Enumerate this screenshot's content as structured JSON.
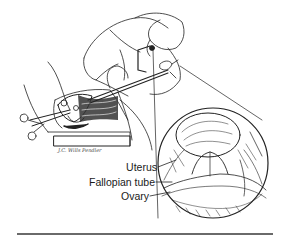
{
  "figure": {
    "labels": [
      {
        "id": "uterus",
        "text": "Uterus"
      },
      {
        "id": "fallopian-tube",
        "text": "Fallopian tube"
      },
      {
        "id": "ovary",
        "text": "Ovary"
      }
    ],
    "signature": "J.C. Wills Pendler",
    "colors": {
      "ink": "#1a1a1a",
      "rule": "#6a6a6a",
      "background": "#ffffff"
    }
  }
}
